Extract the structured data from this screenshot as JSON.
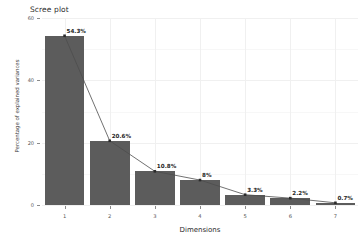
{
  "chart_data": {
    "type": "bar",
    "title": "Scree plot",
    "xlabel": "Dimensions",
    "ylabel": "Percentage of explained variances",
    "categories": [
      "1",
      "2",
      "3",
      "4",
      "5",
      "6",
      "7"
    ],
    "values": [
      54.3,
      20.6,
      10.8,
      8,
      3.3,
      2.2,
      0.7
    ],
    "point_labels": [
      "54.3%",
      "20.6%",
      "10.8%",
      "8%",
      "3.3%",
      "2.2%",
      "0.7%"
    ],
    "series": [
      {
        "name": "Percentage of explained variances",
        "values": [
          54.3,
          20.6,
          10.8,
          8,
          3.3,
          2.2,
          0.7
        ]
      }
    ],
    "ylim": [
      0,
      60
    ],
    "yticks": [
      "0",
      "20",
      "40",
      "60"
    ],
    "ytick_values": [
      0,
      20,
      40,
      60
    ],
    "xticks": [
      "1",
      "2",
      "3",
      "4",
      "5",
      "6",
      "7"
    ],
    "grid": true,
    "legend": "none",
    "overlay": "line-with-points",
    "bar_color": "#5c5c5c",
    "line_color": "#4d4d4d",
    "point_color": "#2b2b2b",
    "background_color": "#ffffff",
    "grid_color": "#f0f0f0"
  }
}
